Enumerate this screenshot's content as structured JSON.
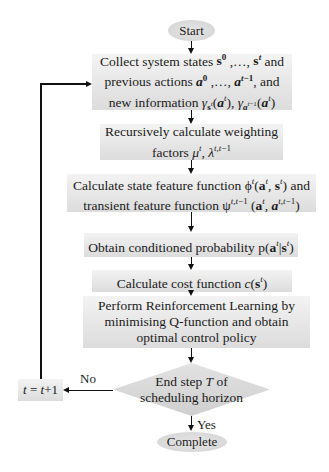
{
  "flowchart": {
    "start": "Start",
    "steps": [
      {
        "id": "collect",
        "lines": [
          "Collect system states s⁰ ,…, sᵗ and",
          "previous actions a⁰ ,…, aᵗ⁻¹, and",
          "new information γ_sᵗ(aᵗ), γ_aᵗ⁻¹(aᵗ)"
        ]
      },
      {
        "id": "weighting",
        "lines": [
          "Recursively calculate weighting",
          "factors μᵗ, λᵗ,ᵗ⁻¹"
        ]
      },
      {
        "id": "feature",
        "lines": [
          "Calculate state feature function ϕᵗ(aᵗ, sᵗ) and",
          "transient feature function ψᵗ,ᵗ⁻¹ (aᵗ, aᵗ,ᵗ⁻¹)"
        ]
      },
      {
        "id": "probability",
        "lines": [
          "Obtain conditioned probability p(aᵗ|sᵗ)"
        ]
      },
      {
        "id": "cost",
        "lines": [
          "Calculate cost function c(sᵗ)"
        ]
      },
      {
        "id": "rl",
        "lines": [
          "Perform Reinforcement Learning by",
          "minimising Q-function and obtain",
          "optimal control policy"
        ]
      }
    ],
    "decision": {
      "line1_prefix": "End step ",
      "line1_var": "T",
      "line1_suffix": " of",
      "line2": "scheduling horizon"
    },
    "loop_box": "t = t+1",
    "no_label": "No",
    "yes_label": "Yes",
    "end": "Complete"
  }
}
